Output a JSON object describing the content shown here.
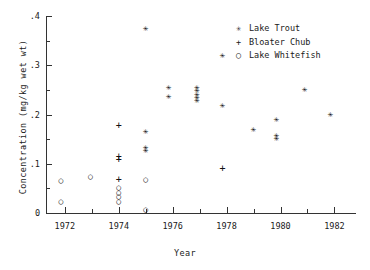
{
  "chart_data": {
    "type": "scatter",
    "title": "",
    "xlabel": "Year",
    "ylabel": "Concentration (mg/kg wet wt)",
    "xlim": [
      1971.3,
      1982.8
    ],
    "ylim": [
      0,
      0.4
    ],
    "xticks": [
      1972,
      1974,
      1976,
      1978,
      1980,
      1982
    ],
    "xtick_labels": [
      "1972",
      "1974",
      "1976",
      "1978",
      "1980",
      "1982"
    ],
    "xminor_step": 1,
    "yticks": [
      0,
      0.1,
      0.2,
      0.3,
      0.4
    ],
    "ytick_labels": [
      "0",
      ".1",
      ".2",
      ".3",
      ".4"
    ],
    "yminor_step": 0.05,
    "grid": false,
    "legend_position": "top-right",
    "series": [
      {
        "name": "Lake Trout",
        "marker": "asterisk",
        "glyph": "✳",
        "points": [
          {
            "x": 1975.0,
            "y": 0.375
          },
          {
            "x": 1975.0,
            "y": 0.165
          },
          {
            "x": 1975.0,
            "y": 0.133
          },
          {
            "x": 1975.0,
            "y": 0.127
          },
          {
            "x": 1975.85,
            "y": 0.255
          },
          {
            "x": 1975.85,
            "y": 0.236
          },
          {
            "x": 1976.9,
            "y": 0.255
          },
          {
            "x": 1976.9,
            "y": 0.248
          },
          {
            "x": 1976.9,
            "y": 0.241
          },
          {
            "x": 1976.9,
            "y": 0.234
          },
          {
            "x": 1976.9,
            "y": 0.229
          },
          {
            "x": 1977.85,
            "y": 0.319
          },
          {
            "x": 1977.85,
            "y": 0.218
          },
          {
            "x": 1979.0,
            "y": 0.17
          },
          {
            "x": 1979.85,
            "y": 0.19
          },
          {
            "x": 1979.85,
            "y": 0.158
          },
          {
            "x": 1979.85,
            "y": 0.151
          },
          {
            "x": 1980.9,
            "y": 0.251
          },
          {
            "x": 1981.85,
            "y": 0.201
          }
        ]
      },
      {
        "name": "Bloater Chub",
        "marker": "plus",
        "glyph": "+",
        "points": [
          {
            "x": 1974.0,
            "y": 0.175
          },
          {
            "x": 1974.0,
            "y": 0.113
          },
          {
            "x": 1974.0,
            "y": 0.107
          },
          {
            "x": 1974.0,
            "y": 0.065
          },
          {
            "x": 1977.85,
            "y": 0.089
          }
        ]
      },
      {
        "name": "Lake Whitefish",
        "marker": "circle",
        "glyph": "○",
        "points": [
          {
            "x": 1971.85,
            "y": 0.063
          },
          {
            "x": 1971.85,
            "y": 0.021
          },
          {
            "x": 1972.95,
            "y": 0.073
          },
          {
            "x": 1974.0,
            "y": 0.05
          },
          {
            "x": 1974.0,
            "y": 0.04
          },
          {
            "x": 1974.0,
            "y": 0.031
          },
          {
            "x": 1974.0,
            "y": 0.022
          },
          {
            "x": 1975.0,
            "y": 0.065
          },
          {
            "x": 1975.0,
            "y": 0.005
          }
        ]
      }
    ]
  },
  "legend": {
    "items": [
      {
        "label": "Lake Trout",
        "glyph": "✳"
      },
      {
        "label": "Bloater Chub",
        "glyph": "+"
      },
      {
        "label": "Lake Whitefish",
        "glyph": "○"
      }
    ]
  }
}
